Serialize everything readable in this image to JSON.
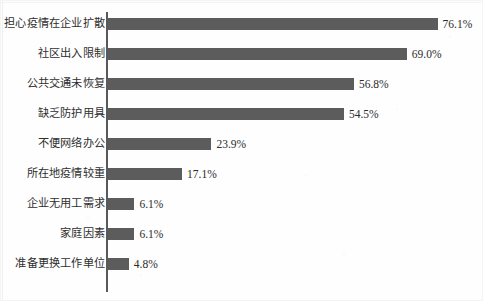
{
  "figure": {
    "background_color": "#fefefe",
    "bar_color": "#5c5c5c",
    "axis_color": "#595959",
    "label_color": "#2e2e2e",
    "value_label_color": "#2b2b2b"
  },
  "chart_data": {
    "type": "bar",
    "orientation": "horizontal",
    "title": "",
    "subtitle": "",
    "xlabel": "",
    "ylabel": "",
    "xlim": [
      0,
      80
    ],
    "grid": false,
    "legend": false,
    "legend_position": "none",
    "axis_line": "category",
    "value_suffix": "%",
    "categories": [
      "担心疫情在企业扩散",
      "社区出入限制",
      "公共交通未恢复",
      "缺乏防护用具",
      "不便网络办公",
      "所在地疫情较重",
      "企业无用工需求",
      "家庭因素",
      "准备更换工作单位"
    ],
    "values": [
      76.1,
      69.0,
      56.8,
      54.5,
      23.9,
      17.1,
      6.1,
      6.1,
      4.8
    ],
    "data_labels": [
      "76.1%",
      "69.0%",
      "56.8%",
      "54.5%",
      "23.9%",
      "17.1%",
      "6.1%",
      "6.1%",
      "4.8%"
    ],
    "annotations": []
  },
  "geometry": {
    "px_per_percent": 4.33,
    "bar_origin_x": 107,
    "first_row_top": 8,
    "row_pitch": 30,
    "bar_height": 12,
    "value_label_gap": 5
  }
}
